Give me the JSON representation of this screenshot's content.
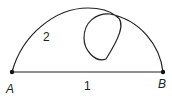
{
  "diagram": {
    "points": [
      {
        "id": "A",
        "label": "A",
        "x": 12,
        "y": 72
      },
      {
        "id": "B",
        "label": "B",
        "x": 163,
        "y": 72
      }
    ],
    "paths": [
      {
        "id": "path-1",
        "label": "1",
        "type": "straight line from A to B"
      },
      {
        "id": "path-2",
        "label": "2",
        "type": "curved arc from A to B with a loop"
      }
    ],
    "stroke_color": "#222222"
  }
}
